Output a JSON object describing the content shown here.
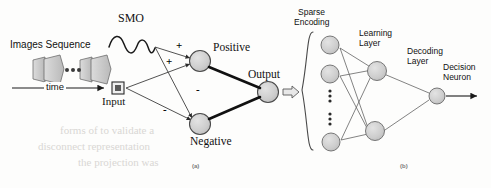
{
  "figure": {
    "panel_a": {
      "tag": "(a)",
      "labels": {
        "images_sequence": "Images Sequence",
        "time": "time",
        "smo": "SMO",
        "input": "Input",
        "positive": "Positive",
        "negative": "Negative",
        "output": "Output"
      },
      "edge_signs": {
        "smo_to_positive": "+",
        "input_to_positive": "+",
        "smo_to_negative": "-",
        "input_to_negative": "-"
      },
      "nodes": [
        {
          "id": "input",
          "label": "Input",
          "shape": "square",
          "cx": 118,
          "cy": 88
        },
        {
          "id": "positive",
          "label": "Positive",
          "shape": "circle",
          "cx": 200,
          "cy": 60
        },
        {
          "id": "negative",
          "label": "Negative",
          "shape": "circle",
          "cx": 200,
          "cy": 124
        },
        {
          "id": "output",
          "label": "Output",
          "shape": "circle",
          "cx": 268,
          "cy": 92
        }
      ]
    },
    "panel_b": {
      "tag": "(b)",
      "labels": {
        "sparse_encoding": "Sparse\nEncoding",
        "sparse_encoding_line1": "Sparse",
        "sparse_encoding_line2": "Encoding",
        "learning_layer_line1": "Learning",
        "learning_layer_line2": "Layer",
        "decoding_layer_line1": "Decoding",
        "decoding_layer_line2": "Layer",
        "decision_neuron_line1": "Decision",
        "decision_neuron_line2": "Neuron"
      },
      "layers": [
        {
          "name": "Sparse Encoding",
          "visible_nodes": 3,
          "has_ellipsis": true
        },
        {
          "name": "Learning Layer",
          "visible_nodes": 2
        },
        {
          "name": "Decoding Layer",
          "visible_nodes": 1
        },
        {
          "name": "Decision Neuron",
          "visible_nodes": 0
        }
      ]
    },
    "colors": {
      "node_fill": "#cfcfcf",
      "node_stroke": "#4a4a4a",
      "edge_thin": "#555555",
      "edge_thick": "#111111",
      "text": "#111111",
      "frame_fill": "#c9c9c9",
      "background": "#fdfdfc",
      "ghost_text": "#d9d7d4"
    }
  },
  "ghost_text": {
    "lines": [
      "forms of to validate a",
      "disconnect representation",
      "the projection was"
    ]
  }
}
